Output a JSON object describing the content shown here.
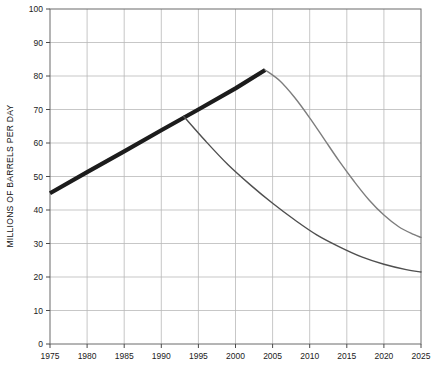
{
  "chart_data": {
    "type": "line",
    "title": "",
    "subtitle": "",
    "xlabel": "",
    "ylabel": "MILLIONS OF BARRELS PER DAY",
    "xlim": [
      1975,
      2025
    ],
    "ylim": [
      0,
      100
    ],
    "grid": true,
    "legend": "none",
    "x_ticks": [
      1975,
      1980,
      1985,
      1990,
      1995,
      2000,
      2005,
      2010,
      2015,
      2020,
      2025
    ],
    "y_ticks": [
      0,
      10,
      20,
      30,
      40,
      50,
      60,
      70,
      80,
      90,
      100
    ],
    "x_tick_labels": [
      "1975",
      "1980",
      "1985",
      "1990",
      "1995",
      "2000",
      "2005",
      "2010",
      "2015",
      "2020",
      "2025"
    ],
    "y_tick_labels": [
      "0",
      "10",
      "20",
      "30",
      "40",
      "50",
      "60",
      "70",
      "80",
      "90",
      "100"
    ],
    "series": [
      {
        "name": "historical-and-peak-trend",
        "style": "thick-black-line",
        "color": "#1c1c1c",
        "width": 4.2,
        "x": [
          1975,
          1980,
          1985,
          1990,
          1995,
          2000,
          2004
        ],
        "values": [
          45,
          51.3,
          57.5,
          63.8,
          70,
          76.3,
          81.8
        ]
      },
      {
        "name": "upper-decline-scenario",
        "style": "thin-gray-curve",
        "color": "#7d7d7d",
        "width": 1.4,
        "x": [
          2004,
          2006,
          2008,
          2010,
          2012,
          2014,
          2016,
          2018,
          2020,
          2022,
          2024,
          2025
        ],
        "values": [
          81.8,
          78.5,
          73.5,
          67.5,
          61,
          54.5,
          48.5,
          43,
          38.5,
          35,
          32.7,
          31.8
        ]
      },
      {
        "name": "lower-decline-scenario",
        "style": "thin-dark-gray-curve",
        "color": "#4f4f4f",
        "width": 1.4,
        "x": [
          1993,
          1996,
          1999,
          2002,
          2005,
          2008,
          2011,
          2014,
          2017,
          2020,
          2023,
          2025
        ],
        "values": [
          68,
          60.5,
          53.5,
          47.5,
          42,
          37,
          32.5,
          29,
          26,
          23.8,
          22.2,
          21.5
        ]
      }
    ],
    "annotations": []
  },
  "colors": {
    "background": "#ffffff",
    "grid": "#b9b9b9",
    "axis": "#4a4a4a",
    "tick_label": "#222222",
    "series_thick_black": "#1c1c1c",
    "series_gray": "#7d7d7d",
    "series_dark_gray": "#4f4f4f"
  }
}
